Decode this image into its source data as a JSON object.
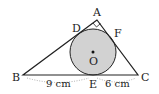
{
  "diagram": {
    "type": "geometry",
    "colors": {
      "stroke": "#222222",
      "circle_fill": "#d2d2d2",
      "dotted": "#999999"
    },
    "points": {
      "A": {
        "label": "A"
      },
      "B": {
        "label": "B"
      },
      "C": {
        "label": "C"
      },
      "D": {
        "label": "D"
      },
      "E": {
        "label": "E"
      },
      "F": {
        "label": "F"
      },
      "O": {
        "label": "O"
      }
    },
    "measurements": {
      "BE": "9 cm",
      "EC": "6 cm"
    }
  }
}
